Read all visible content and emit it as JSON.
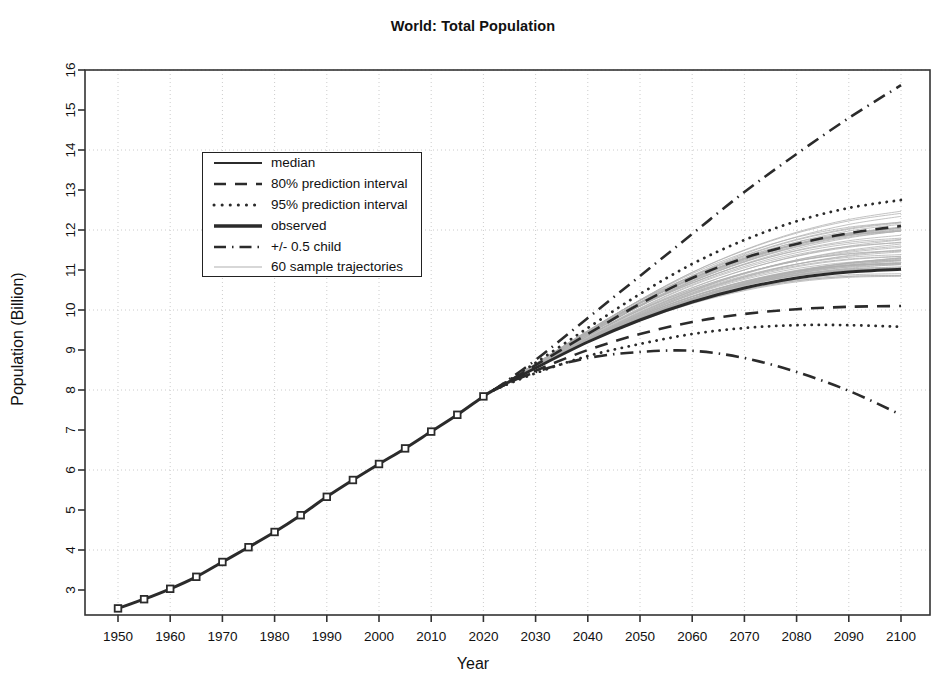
{
  "chart_data": {
    "type": "line",
    "title": "World: Total Population",
    "xlabel": "Year",
    "ylabel": "Population (Billion)",
    "xlim": [
      1950,
      2100
    ],
    "ylim": [
      2.4,
      16.2
    ],
    "xticks": [
      1950,
      1960,
      1970,
      1980,
      1990,
      2000,
      2010,
      2020,
      2030,
      2040,
      2050,
      2060,
      2070,
      2080,
      2090,
      2100
    ],
    "yticks": [
      3,
      4,
      5,
      6,
      7,
      8,
      9,
      10,
      11,
      12,
      13,
      14,
      15,
      16
    ],
    "grid": "dotted-both",
    "legend_position": "upper-left-inside",
    "series": [
      {
        "name": "observed",
        "style": "thick-solid",
        "x": [
          1950,
          1955,
          1960,
          1965,
          1970,
          1975,
          1980,
          1985,
          1990,
          1995,
          2000,
          2005,
          2010,
          2015,
          2020,
          2022
        ],
        "values": [
          2.54,
          2.77,
          3.03,
          3.33,
          3.7,
          4.07,
          4.45,
          4.87,
          5.33,
          5.75,
          6.15,
          6.54,
          6.96,
          7.38,
          7.84,
          8.0
        ]
      },
      {
        "name": "median",
        "style": "thick-solid",
        "x": [
          2022,
          2030,
          2040,
          2050,
          2060,
          2070,
          2080,
          2090,
          2100
        ],
        "values": [
          8.0,
          8.55,
          9.2,
          9.75,
          10.2,
          10.55,
          10.8,
          10.95,
          11.02
        ]
      },
      {
        "name": "80% prediction interval upper",
        "style": "dashed",
        "x": [
          2022,
          2030,
          2040,
          2050,
          2060,
          2070,
          2080,
          2090,
          2100
        ],
        "values": [
          8.0,
          8.62,
          9.4,
          10.15,
          10.8,
          11.3,
          11.65,
          11.92,
          12.1
        ]
      },
      {
        "name": "80% prediction interval lower",
        "style": "dashed",
        "x": [
          2022,
          2030,
          2040,
          2050,
          2060,
          2070,
          2080,
          2090,
          2100
        ],
        "values": [
          8.0,
          8.48,
          9.0,
          9.4,
          9.7,
          9.9,
          10.02,
          10.08,
          10.1
        ]
      },
      {
        "name": "95% prediction interval upper",
        "style": "dotted",
        "x": [
          2022,
          2030,
          2040,
          2050,
          2060,
          2070,
          2080,
          2090,
          2100
        ],
        "values": [
          8.0,
          8.68,
          9.55,
          10.4,
          11.15,
          11.75,
          12.22,
          12.55,
          12.75
        ]
      },
      {
        "name": "95% prediction interval lower",
        "style": "dotted",
        "x": [
          2022,
          2030,
          2040,
          2050,
          2060,
          2070,
          2080,
          2090,
          2100
        ],
        "values": [
          8.0,
          8.42,
          8.85,
          9.15,
          9.4,
          9.55,
          9.62,
          9.62,
          9.58
        ]
      },
      {
        "name": "+0.5 child",
        "style": "dash-dot",
        "x": [
          2022,
          2030,
          2040,
          2050,
          2060,
          2070,
          2080,
          2090,
          2100
        ],
        "values": [
          8.0,
          8.75,
          9.8,
          10.85,
          11.9,
          12.95,
          13.9,
          14.8,
          15.62
        ]
      },
      {
        "name": "-0.5 child",
        "style": "dash-dot",
        "x": [
          2022,
          2030,
          2040,
          2050,
          2060,
          2070,
          2080,
          2090,
          2100
        ],
        "values": [
          8.0,
          8.45,
          8.8,
          8.95,
          8.98,
          8.8,
          8.45,
          7.98,
          7.38
        ]
      }
    ],
    "sample_trajectories_count": 60,
    "annotations": []
  },
  "legend": {
    "items": [
      {
        "label": "median",
        "key": "solid-line"
      },
      {
        "label": "80% prediction interval",
        "key": "dashed-line"
      },
      {
        "label": "95% prediction interval",
        "key": "dotted-line"
      },
      {
        "label": "observed",
        "key": "thick-solid-line"
      },
      {
        "label": "+/- 0.5 child",
        "key": "dash-dot-line"
      },
      {
        "label": "60 sample trajectories",
        "key": "thin-gray-line"
      }
    ]
  },
  "colors": {
    "line": "#2b2b2b",
    "trajectory": "#b0b0b0",
    "grid": "#cccccc",
    "axis": "#333333",
    "background": "#ffffff"
  }
}
